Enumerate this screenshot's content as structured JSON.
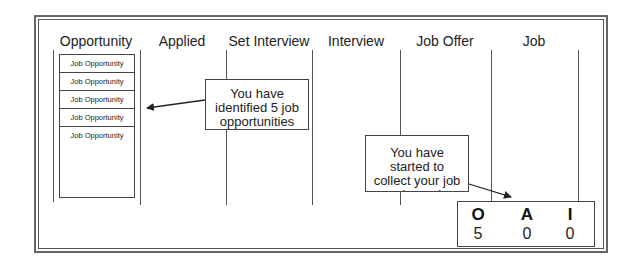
{
  "columns": [
    "Opportunity",
    "Applied",
    "Set Interview",
    "Interview",
    "Job Offer",
    "Job"
  ],
  "opportunity_stack": {
    "items": [
      "Job Opportunity",
      "Job Opportunity",
      "Job Opportunity",
      "Job Opportunity",
      "Job Opportunity"
    ]
  },
  "callouts": {
    "identified": {
      "lines": [
        "You have",
        "identified 5 job",
        "opportunities"
      ]
    },
    "collect": {
      "lines": [
        "You have",
        "started to",
        "collect your job",
        "search numbers"
      ]
    }
  },
  "counter": {
    "columns": [
      {
        "letter": "O",
        "value": "5"
      },
      {
        "letter": "A",
        "value": "0"
      },
      {
        "letter": "I",
        "value": "0"
      }
    ]
  }
}
